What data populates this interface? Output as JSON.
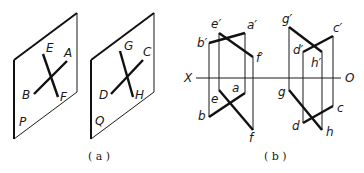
{
  "figure_a": {
    "caption": "( a )",
    "plane_p": {
      "label": "P",
      "points": {
        "E": "E",
        "F": "F",
        "A": "A",
        "B": "B"
      }
    },
    "plane_q": {
      "label": "Q",
      "points": {
        "G": "G",
        "H": "H",
        "C": "C",
        "D": "D"
      }
    }
  },
  "figure_b": {
    "caption": "( b )",
    "axis": {
      "left": "X",
      "right": "O"
    },
    "left_pair": {
      "e_prime": "e′",
      "a_prime": "a′",
      "b_prime": "b′",
      "f_prime": "f′",
      "e": "e",
      "a": "a",
      "b": "b",
      "f": "f"
    },
    "right_pair": {
      "g_prime": "g′",
      "c_prime": "c′",
      "d_prime": "d′",
      "h_prime": "h′",
      "g": "g",
      "c": "c",
      "d": "d",
      "h": "h"
    }
  }
}
